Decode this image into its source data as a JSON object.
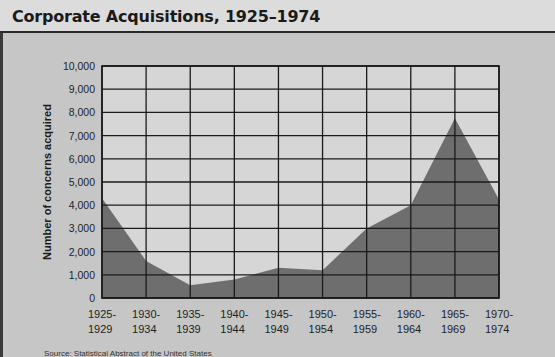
{
  "title": "Corporate Acquisitions, 1925–1974",
  "source_text": "Source: Statistical Abstract of the United States",
  "chart_data": {
    "type": "area",
    "title": "Corporate Acquisitions, 1925–1974",
    "xlabel": "",
    "ylabel": "Number of concerns acquired",
    "categories": [
      "1925-1929",
      "1930-1934",
      "1935-1939",
      "1940-1944",
      "1945-1949",
      "1950-1954",
      "1955-1959",
      "1960-1964",
      "1965-1969",
      "1970-1974"
    ],
    "x_tick_lines": [
      [
        "1925-",
        "1929"
      ],
      [
        "1930-",
        "1934"
      ],
      [
        "1935-",
        "1939"
      ],
      [
        "1940-",
        "1944"
      ],
      [
        "1945-",
        "1949"
      ],
      [
        "1950-",
        "1954"
      ],
      [
        "1955-",
        "1959"
      ],
      [
        "1960-",
        "1964"
      ],
      [
        "1965-",
        "1969"
      ],
      [
        "1970-",
        "1974"
      ]
    ],
    "series": [
      {
        "name": "Concerns acquired",
        "values": [
          4300,
          1600,
          550,
          800,
          1300,
          1200,
          3000,
          4000,
          7750,
          4250
        ]
      }
    ],
    "y_ticks": [
      "0",
      "1,000",
      "2,000",
      "3,000",
      "4,000",
      "5,000",
      "6,000",
      "7,000",
      "8,000",
      "9,000",
      "10,000"
    ],
    "ylim": [
      0,
      10000
    ],
    "grid": true,
    "legend": "none",
    "colors": {
      "fill": "#6e6e6e",
      "plot_bg": "#d6d6d6",
      "grid": "#1a1a1a"
    }
  }
}
